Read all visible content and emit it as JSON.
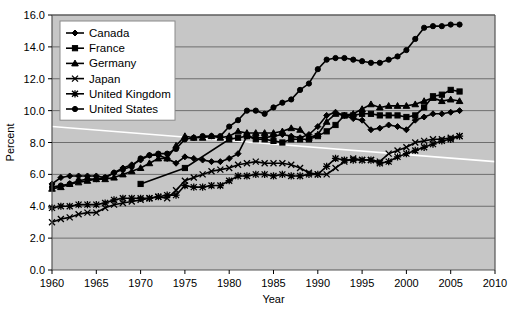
{
  "chart_data": {
    "type": "line",
    "title": "",
    "xlabel": "Year",
    "ylabel": "Percent",
    "xlim": [
      1960,
      2010
    ],
    "ylim": [
      0.0,
      16.0
    ],
    "xticks": [
      "1960",
      "1965",
      "1970",
      "1975",
      "1980",
      "1985",
      "1990",
      "1995",
      "2000",
      "2005",
      "2010"
    ],
    "yticks": [
      "0.0",
      "2.0",
      "4.0",
      "6.0",
      "8.0",
      "10.0",
      "12.0",
      "14.0",
      "16.0"
    ],
    "grid": true,
    "legend_position": "top-left",
    "plot_background": "#c6c6c6",
    "line_color": "#000000",
    "series": [
      {
        "name": "Canada",
        "marker": "diamond",
        "x": [
          1960,
          1961,
          1962,
          1963,
          1964,
          1965,
          1966,
          1967,
          1968,
          1969,
          1970,
          1971,
          1972,
          1973,
          1974,
          1975,
          1976,
          1977,
          1978,
          1979,
          1980,
          1981,
          1982,
          1983,
          1984,
          1985,
          1986,
          1987,
          1988,
          1989,
          1990,
          1991,
          1992,
          1993,
          1994,
          1995,
          1996,
          1997,
          1998,
          1999,
          2000,
          2001,
          2002,
          2003,
          2004,
          2005,
          2006
        ],
        "values": [
          5.4,
          5.8,
          5.9,
          5.9,
          5.9,
          5.9,
          5.8,
          6.1,
          6.4,
          6.6,
          6.9,
          7.2,
          7.2,
          7.0,
          6.7,
          7.1,
          7.0,
          6.9,
          6.8,
          6.8,
          7.0,
          7.3,
          8.4,
          8.3,
          8.3,
          8.4,
          8.5,
          8.4,
          8.3,
          8.5,
          9.0,
          9.7,
          9.9,
          9.7,
          9.5,
          9.4,
          8.8,
          8.9,
          9.1,
          9.0,
          8.8,
          9.4,
          9.6,
          9.8,
          9.8,
          9.9,
          10.0
        ]
      },
      {
        "name": "France",
        "marker": "square",
        "x": [
          1970,
          1975,
          1980,
          1981,
          1982,
          1983,
          1984,
          1985,
          1986,
          1987,
          1988,
          1989,
          1990,
          1991,
          1992,
          1993,
          1994,
          1995,
          1996,
          1997,
          1998,
          1999,
          2000,
          2001,
          2002,
          2003,
          2004,
          2005,
          2006
        ],
        "values": [
          5.4,
          6.4,
          8.2,
          8.3,
          8.4,
          8.2,
          8.2,
          8.1,
          8.0,
          8.2,
          8.2,
          8.2,
          8.4,
          8.7,
          9.1,
          9.7,
          9.7,
          9.8,
          9.8,
          9.7,
          9.7,
          9.7,
          9.6,
          9.7,
          10.2,
          10.9,
          11.0,
          11.3,
          11.2
        ]
      },
      {
        "name": "Germany",
        "marker": "triangle",
        "x": [
          1960,
          1961,
          1962,
          1963,
          1964,
          1965,
          1966,
          1967,
          1968,
          1969,
          1970,
          1971,
          1972,
          1973,
          1974,
          1975,
          1976,
          1977,
          1978,
          1979,
          1980,
          1981,
          1982,
          1983,
          1984,
          1985,
          1986,
          1987,
          1988,
          1989,
          1990,
          1991,
          1992,
          1993,
          1994,
          1995,
          1996,
          1997,
          1998,
          1999,
          2000,
          2001,
          2002,
          2003,
          2004,
          2005,
          2006
        ],
        "values": [
          5.1,
          5.2,
          5.4,
          5.5,
          5.6,
          5.7,
          5.7,
          5.8,
          6.0,
          6.2,
          6.4,
          6.7,
          7.0,
          7.0,
          7.8,
          8.4,
          8.3,
          8.3,
          8.4,
          8.3,
          8.4,
          8.7,
          8.6,
          8.6,
          8.6,
          8.6,
          8.7,
          8.9,
          8.8,
          8.3,
          8.5,
          9.3,
          9.8,
          9.7,
          9.8,
          10.1,
          10.4,
          10.2,
          10.3,
          10.3,
          10.3,
          10.4,
          10.6,
          10.8,
          10.6,
          10.7,
          10.6
        ]
      },
      {
        "name": "Japan",
        "marker": "x",
        "x": [
          1960,
          1961,
          1962,
          1963,
          1964,
          1965,
          1966,
          1967,
          1968,
          1969,
          1970,
          1971,
          1972,
          1973,
          1974,
          1975,
          1976,
          1977,
          1978,
          1979,
          1980,
          1981,
          1982,
          1983,
          1984,
          1985,
          1986,
          1987,
          1988,
          1989,
          1990,
          1991,
          1992,
          1993,
          1994,
          1995,
          1996,
          1997,
          1998,
          1999,
          2000,
          2001,
          2002,
          2003,
          2004,
          2005,
          2006
        ],
        "values": [
          3.0,
          3.2,
          3.3,
          3.5,
          3.6,
          3.6,
          3.9,
          4.1,
          4.2,
          4.3,
          4.4,
          4.5,
          4.6,
          4.5,
          5.0,
          5.6,
          5.8,
          6.0,
          6.2,
          6.3,
          6.4,
          6.6,
          6.7,
          6.8,
          6.7,
          6.7,
          6.7,
          6.6,
          6.4,
          6.1,
          6.0,
          6.0,
          6.4,
          6.8,
          7.0,
          6.9,
          6.9,
          6.8,
          7.3,
          7.5,
          7.7,
          8.0,
          8.1,
          8.2,
          8.2,
          8.3,
          8.4
        ]
      },
      {
        "name": "United Kingdom",
        "marker": "asterisk",
        "x": [
          1960,
          1961,
          1962,
          1963,
          1964,
          1965,
          1966,
          1967,
          1968,
          1969,
          1970,
          1971,
          1972,
          1973,
          1974,
          1975,
          1976,
          1977,
          1978,
          1979,
          1980,
          1981,
          1982,
          1983,
          1984,
          1985,
          1986,
          1987,
          1988,
          1989,
          1990,
          1991,
          1992,
          1993,
          1994,
          1995,
          1996,
          1997,
          1998,
          1999,
          2000,
          2001,
          2002,
          2003,
          2004,
          2005,
          2006
        ],
        "values": [
          3.9,
          4.0,
          4.0,
          4.1,
          4.1,
          4.1,
          4.2,
          4.4,
          4.5,
          4.5,
          4.5,
          4.5,
          4.6,
          4.7,
          4.7,
          5.3,
          5.2,
          5.2,
          5.3,
          5.3,
          5.6,
          5.9,
          5.9,
          6.0,
          6.0,
          5.9,
          6.0,
          5.9,
          5.9,
          6.0,
          6.0,
          6.5,
          7.0,
          6.9,
          6.9,
          6.9,
          6.9,
          6.7,
          6.8,
          7.1,
          7.3,
          7.5,
          7.7,
          7.9,
          8.1,
          8.2,
          8.4
        ]
      },
      {
        "name": "United States",
        "marker": "circle",
        "x": [
          1960,
          1961,
          1962,
          1963,
          1964,
          1965,
          1966,
          1967,
          1968,
          1969,
          1970,
          1971,
          1972,
          1973,
          1974,
          1975,
          1976,
          1977,
          1978,
          1979,
          1980,
          1981,
          1982,
          1983,
          1984,
          1985,
          1986,
          1987,
          1988,
          1989,
          1990,
          1991,
          1992,
          1993,
          1994,
          1995,
          1996,
          1997,
          1998,
          1999,
          2000,
          2001,
          2002,
          2003,
          2004,
          2005,
          2006
        ],
        "values": [
          5.2,
          5.3,
          5.4,
          5.6,
          5.7,
          5.7,
          5.8,
          6.1,
          6.3,
          6.5,
          7.0,
          7.2,
          7.3,
          7.3,
          7.6,
          8.2,
          8.3,
          8.4,
          8.4,
          8.4,
          9.0,
          9.4,
          10.0,
          10.0,
          9.8,
          10.2,
          10.5,
          10.7,
          11.3,
          11.7,
          12.6,
          13.2,
          13.3,
          13.3,
          13.2,
          13.1,
          13.0,
          13.0,
          13.2,
          13.4,
          13.8,
          14.5,
          15.2,
          15.3,
          15.3,
          15.4,
          15.4
        ]
      }
    ],
    "overlay_trend_line": {
      "name": "white-trend-overlay",
      "color": "#ffffff",
      "x": [
        1960,
        2010
      ],
      "values": [
        9.0,
        6.8
      ]
    }
  },
  "legend": {
    "items": [
      {
        "label": "Canada",
        "marker": "diamond"
      },
      {
        "label": "France",
        "marker": "square"
      },
      {
        "label": "Germany",
        "marker": "triangle"
      },
      {
        "label": "Japan",
        "marker": "x"
      },
      {
        "label": "United Kingdom",
        "marker": "asterisk"
      },
      {
        "label": "United States",
        "marker": "circle"
      }
    ]
  }
}
